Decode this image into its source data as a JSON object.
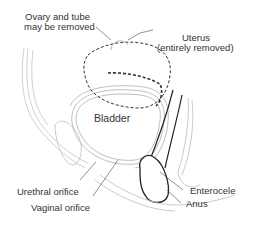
{
  "diagram": {
    "type": "anatomical-illustration",
    "labels": {
      "ovary_line1": "Ovary and tube",
      "ovary_line2": "may be removed",
      "uterus_line1": "Uterus",
      "uterus_line2": "(entirely removed)",
      "bladder": "Bladder",
      "enterocele": "Enterocele",
      "anus": "Anus",
      "urethral_orifice": "Urethral orifice",
      "vaginal_orifice": "Vaginal orifice"
    },
    "colors": {
      "line": "#333333",
      "light_line": "#b0b0b0",
      "text": "#333333",
      "background": "#ffffff"
    }
  }
}
